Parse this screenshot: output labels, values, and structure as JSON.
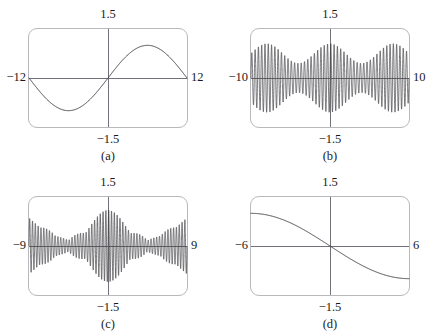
{
  "figure": {
    "panel_count": 4,
    "layout": "2x2 grid of graphing-calculator viewport panels"
  },
  "style": {
    "frame_color": "#b9b9bd",
    "axis_color": "#6f6f75",
    "curve_color": "#3a3a3f",
    "background_color": "#ffffff",
    "text_color": "#1a1a1a"
  },
  "panels": [
    {
      "id": "a",
      "caption": "(a)",
      "xmin_label": "−12",
      "xmax_label": "12",
      "ymax_label": "1.5",
      "ymin_label": "−1.5"
    },
    {
      "id": "b",
      "caption": "(b)",
      "xmin_label": "−10",
      "xmax_label": "10",
      "ymax_label": "1.5",
      "ymin_label": "−1.5"
    },
    {
      "id": "c",
      "caption": "(c)",
      "xmin_label": "−9",
      "xmax_label": "9",
      "ymax_label": "1.5",
      "ymin_label": "−1.5"
    },
    {
      "id": "d",
      "caption": "(d)",
      "xmin_label": "−6",
      "xmax_label": "6",
      "ymax_label": "1.5",
      "ymin_label": "−1.5"
    }
  ],
  "chart_data": [
    {
      "type": "line",
      "title": "(a)",
      "xlabel": "",
      "ylabel": "",
      "xlim": [
        -12,
        12
      ],
      "ylim": [
        -1.5,
        1.5
      ],
      "xtick_labels": [
        "−12",
        "12"
      ],
      "ytick_labels": [
        "−1.5",
        "1.5"
      ],
      "grid": false,
      "legend": "none",
      "description": "Single smooth sine wave of amplitude 1 completing one full period across the window: zero at x=-12, minimum near x=-6, zero at x=0, maximum near x=6, returning to zero at x=12.",
      "series": [
        {
          "name": "sin(pi*x/12)",
          "formula": "y = sin(pi*x/12)",
          "amplitude": 1.0,
          "period": 24,
          "x": [
            -12,
            -10.5,
            -9,
            -7.5,
            -6,
            -4.5,
            -3,
            -1.5,
            0,
            1.5,
            3,
            4.5,
            6,
            7.5,
            9,
            10.5,
            12
          ],
          "values": [
            0,
            -0.383,
            -0.707,
            -0.924,
            -1,
            -0.924,
            -0.707,
            -0.383,
            0,
            0.383,
            0.707,
            0.924,
            1,
            0.924,
            0.707,
            0.383,
            0
          ]
        }
      ]
    },
    {
      "type": "line",
      "title": "(b)",
      "xlabel": "",
      "ylabel": "",
      "xlim": [
        -10,
        10
      ],
      "ylim": [
        -1.5,
        1.5
      ],
      "xtick_labels": [
        "−10",
        "10"
      ],
      "ytick_labels": [
        "−1.5",
        "1.5"
      ],
      "grid": false,
      "legend": "none",
      "description": "Very high frequency oscillation filling the window, with a slowly varying beat envelope: amplitude is moderate at the edges, dips at nodes near x=-4 and x=+4, and swells to broad lobes in between; envelope maximum near 1.05.",
      "series": [
        {
          "name": "beat-oscillation",
          "formula": "y ~ cos(pi*x/8) * sin(12*pi*x/10)",
          "carrier_cycles_across_window": 48,
          "envelope_max": 1.05,
          "envelope_min": 0.45,
          "envelope_nodes_x": [
            -4,
            4
          ]
        }
      ]
    },
    {
      "type": "line",
      "title": "(c)",
      "xlabel": "",
      "ylabel": "",
      "xlim": [
        -9,
        9
      ],
      "ylim": [
        -1.5,
        1.5
      ],
      "xtick_labels": [
        "−9",
        "9"
      ],
      "ytick_labels": [
        "−1.5",
        "1.5"
      ],
      "grid": false,
      "legend": "none",
      "description": "High frequency oscillation modulated by a pronounced lens-shaped envelope: large central lobe peaking near amplitude 1.1 at x=0, pinching to near-zero nodes at about x=-4.5 and x=+4.5, with smaller side lobes near the left and right edges.",
      "series": [
        {
          "name": "amplitude-modulated-oscillation",
          "formula": "y ~ cos(pi*x/9) * sin(14*pi*x/9)",
          "carrier_cycles_across_window": 56,
          "envelope_center_peak": 1.1,
          "envelope_side_peak": 0.45,
          "envelope_nodes_x": [
            -4.5,
            4.5
          ]
        }
      ]
    },
    {
      "type": "line",
      "title": "(d)",
      "xlabel": "",
      "ylabel": "",
      "xlim": [
        -6,
        6
      ],
      "ylim": [
        -1.5,
        1.5
      ],
      "xtick_labels": [
        "−6",
        "6"
      ],
      "ytick_labels": [
        "−1.5",
        "1.5"
      ],
      "grid": false,
      "legend": "none",
      "description": "Smooth monotonically decreasing S-shaped (sigmoid-like) curve passing through the origin: starts near y=+1.0 at x=-6, falls steeply through zero at x=0, and flattens toward y=-1.0 at x=+6.",
      "series": [
        {
          "name": "decreasing-sigmoid",
          "formula": "y = -sin(pi*x/12) scaled",
          "x": [
            -6,
            -5,
            -4,
            -3,
            -2,
            -1,
            0,
            1,
            2,
            3,
            4,
            5,
            6
          ],
          "values": [
            1.0,
            0.97,
            0.9,
            0.77,
            0.58,
            0.32,
            0,
            -0.32,
            -0.58,
            -0.77,
            -0.9,
            -0.97,
            -1.0
          ]
        }
      ]
    }
  ]
}
